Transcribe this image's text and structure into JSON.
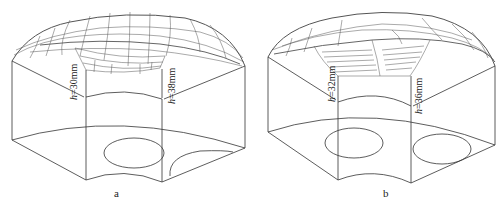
{
  "figure": {
    "panels": [
      {
        "id": "a",
        "caption": "a",
        "labels": [
          {
            "var": "h",
            "text": "=30mm"
          },
          {
            "var": "h",
            "text": "=38mm"
          }
        ]
      },
      {
        "id": "b",
        "caption": "b",
        "labels": [
          {
            "var": "h",
            "text": "=32mm"
          },
          {
            "var": "h",
            "text": "=36mm"
          }
        ]
      }
    ],
    "colors": {
      "line": "#333333",
      "mesh": "#555555",
      "background": "#ffffff"
    }
  }
}
